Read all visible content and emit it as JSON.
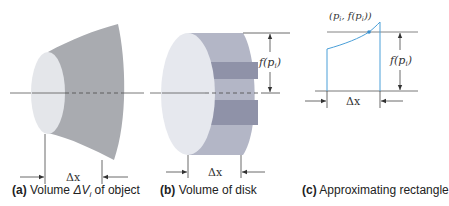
{
  "figure": {
    "panels": [
      {
        "id": "a",
        "tag": "(a)",
        "caption_pre": "Volume ",
        "caption_math": "ΔV",
        "caption_sub": "i",
        "caption_post": " of object",
        "dimension_label": "Δx"
      },
      {
        "id": "b",
        "tag": "(b)",
        "caption": "Volume of disk",
        "dimension_label": "Δx",
        "height_label": "f(p",
        "height_sub": "i",
        "height_close": ")"
      },
      {
        "id": "c",
        "tag": "(c)",
        "caption": "Approximating rectangle",
        "dimension_label": "Δx",
        "point_label_open": "(p",
        "point_sub1": "i",
        "point_label_mid": ", f(p",
        "point_sub2": "i",
        "point_label_close": "))",
        "height_label": "f(p",
        "height_sub": "i",
        "height_close": ")"
      }
    ],
    "colors": {
      "face_light": "#e4e6ea",
      "body_gray": "#a9abb0",
      "disk_band_light": "#b3b6c6",
      "disk_band_dark": "#8f92a8",
      "curve_blue": "#4a9fd8",
      "line": "#333333"
    }
  }
}
